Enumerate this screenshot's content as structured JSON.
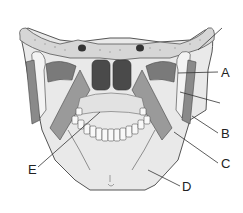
{
  "diagram": {
    "labels": [
      {
        "id": "A",
        "text": "A",
        "x": 221,
        "y": 66
      },
      {
        "id": "B",
        "text": "B",
        "x": 221,
        "y": 127
      },
      {
        "id": "C",
        "text": "C",
        "x": 221,
        "y": 157
      },
      {
        "id": "D",
        "text": "D",
        "x": 182,
        "y": 180
      },
      {
        "id": "E",
        "text": "E",
        "x": 28,
        "y": 163
      }
    ],
    "colors": {
      "bone": "#e6e6e6",
      "bone_outline": "#555555",
      "muscle": "#8a8a8a",
      "muscle_dark": "#5e5e5e",
      "cavity": "#4a4a4a",
      "teeth": "#f6f6f6",
      "label_line": "#333333"
    }
  }
}
